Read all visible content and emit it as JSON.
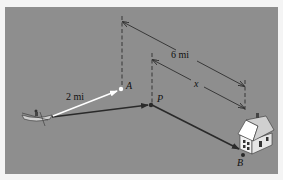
{
  "diagram": {
    "title": "",
    "colors": {
      "background": "#8e8e8e",
      "page": "#f4f4f4",
      "arrow_dark": "#2a2a2a",
      "arrow_light": "#ffffff",
      "house_wall": "#f2f2f2",
      "house_roof": "#d8d8d8"
    },
    "labels": {
      "distance_boat_to_A": "2 mi",
      "distance_A_to_B": "6 mi",
      "distance_P_to_B": "x",
      "point_A": "A",
      "point_P": "P",
      "point_B": "B"
    },
    "elements": [
      {
        "id": "boat",
        "type": "icon",
        "name": "rowboat"
      },
      {
        "id": "house",
        "type": "icon",
        "name": "house"
      },
      {
        "id": "A",
        "type": "point",
        "label": "A"
      },
      {
        "id": "P",
        "type": "point",
        "label": "P"
      },
      {
        "id": "B",
        "type": "point",
        "label": "B"
      }
    ],
    "edges": [
      {
        "from": "boat",
        "to": "A",
        "label": "2 mi",
        "style": "white arrow"
      },
      {
        "from": "boat",
        "to": "P",
        "label": "",
        "style": "dark arrow"
      },
      {
        "from": "P",
        "to": "B",
        "label": "",
        "style": "dark arrow"
      },
      {
        "from": "A",
        "to": "B",
        "label": "6 mi",
        "style": "dimension line"
      },
      {
        "from": "P",
        "to": "B",
        "label": "x",
        "style": "dimension line"
      }
    ]
  }
}
